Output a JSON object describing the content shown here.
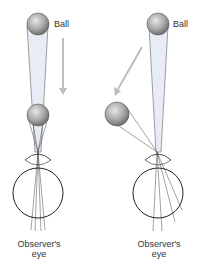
{
  "diagram": {
    "left_panel": {
      "ball_label": "Ball",
      "eye_label_line1": "Observer's",
      "eye_label_line2": "eye"
    },
    "right_panel": {
      "ball_label": "Ball",
      "eye_label_line1": "Observer's",
      "eye_label_line2": "eye"
    },
    "colors": {
      "ball": "#9a9a9a",
      "arrow": "#bdbdbd",
      "cone": "#e8ecf4",
      "line": "#333333"
    }
  }
}
